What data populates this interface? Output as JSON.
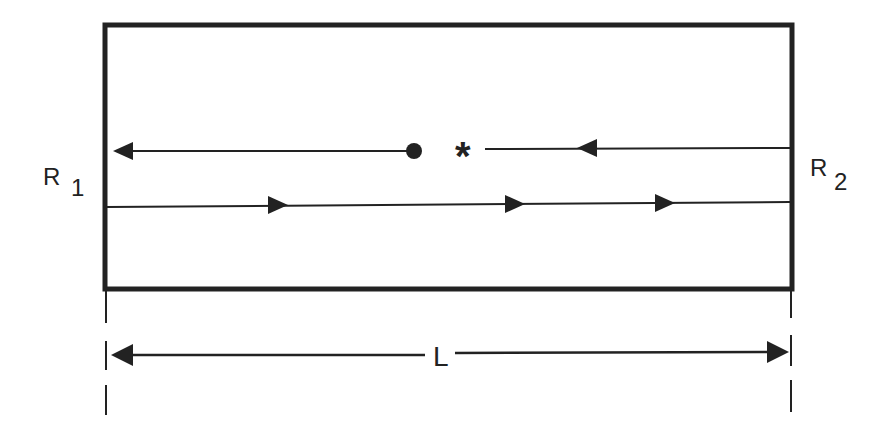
{
  "diagram": {
    "labels": {
      "left_mirror": "R",
      "left_mirror_sub": "1",
      "right_mirror": "R",
      "right_mirror_sub": "2",
      "length": "L",
      "star": "*"
    },
    "colors": {
      "ink": "#222222",
      "background": "#ffffff"
    }
  }
}
